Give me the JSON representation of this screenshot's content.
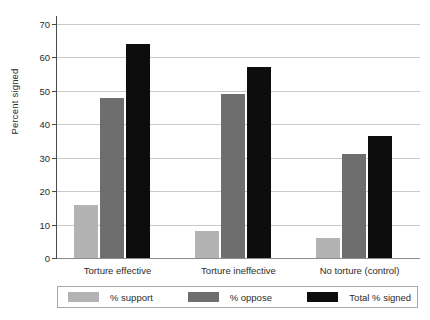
{
  "chart_data": {
    "type": "bar",
    "title": "",
    "xlabel": "",
    "ylabel": "Percent signed",
    "ylim": [
      0,
      70
    ],
    "ytick_step": 10,
    "yticks": [
      70,
      60,
      50,
      40,
      30,
      20,
      10,
      0
    ],
    "grid": true,
    "legend_position": "bottom",
    "categories": [
      "Torture effective",
      "Torture ineffective",
      "No torture (control)"
    ],
    "series": [
      {
        "name": "% support",
        "color": "#b3b3b3",
        "values": [
          16,
          8,
          6
        ]
      },
      {
        "name": "% oppose",
        "color": "#6e6e6e",
        "values": [
          48,
          49,
          31
        ]
      },
      {
        "name": "Total % signed",
        "color": "#0d0d0d",
        "values": [
          64,
          57,
          36.5
        ]
      }
    ]
  },
  "legend": {
    "items": [
      {
        "label": "% support"
      },
      {
        "label": "% oppose"
      },
      {
        "label": "Total % signed"
      }
    ]
  }
}
